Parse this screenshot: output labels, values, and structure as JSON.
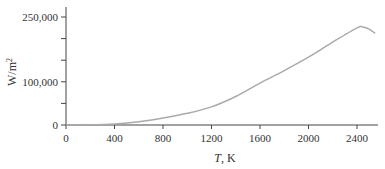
{
  "chart_data": {
    "type": "line",
    "title": "",
    "xlabel": "T, K",
    "xlabel_italic_part": "T",
    "xlabel_unit": ", K",
    "ylabel": "W/m²",
    "xlim": [
      0,
      2550
    ],
    "ylim": [
      0,
      250000
    ],
    "grid": false,
    "legend": null,
    "x_ticks": [
      0,
      400,
      800,
      1200,
      1600,
      2000,
      2400
    ],
    "x_tick_labels": [
      "0",
      "400",
      "800",
      "1200",
      "1600",
      "2000",
      "2400"
    ],
    "y_ticks": [
      0,
      50000,
      100000,
      150000,
      200000,
      250000
    ],
    "y_tick_labels": [
      "0",
      "",
      "100,000",
      "",
      "",
      "250,000"
    ],
    "series": [
      {
        "name": "curve",
        "color": "#aaaaaa",
        "x": [
          0,
          200,
          400,
          600,
          800,
          1000,
          1200,
          1400,
          1600,
          1800,
          2000,
          2200,
          2400,
          2450,
          2500,
          2550
        ],
        "y": [
          0,
          300,
          2500,
          7500,
          16000,
          27000,
          42000,
          66000,
          97000,
          126000,
          157000,
          192000,
          225000,
          227000,
          222000,
          212000
        ]
      }
    ]
  }
}
